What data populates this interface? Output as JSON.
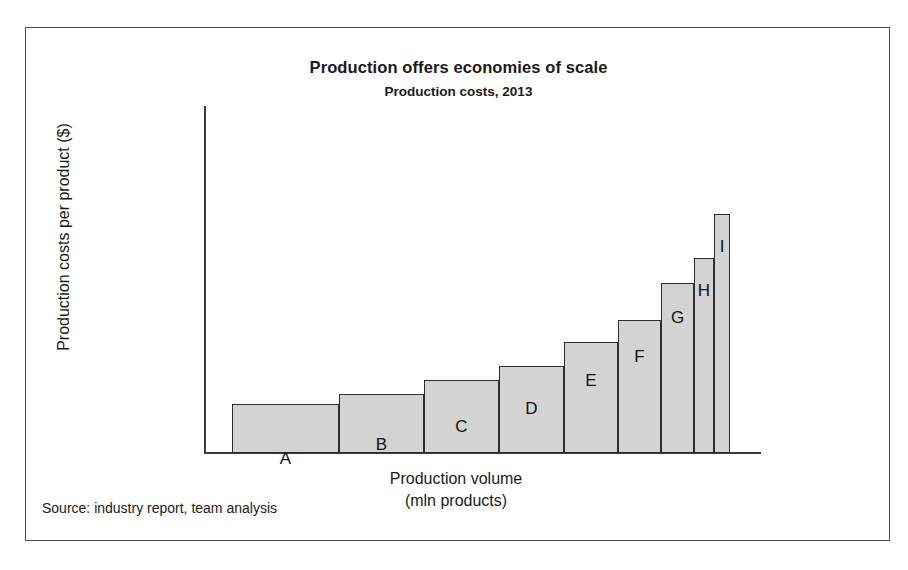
{
  "chart_data": {
    "type": "bar",
    "variant": "variable-width-bar",
    "title": "Production offers economies of scale",
    "subtitle": "Production costs, 2013",
    "xlabel": "Production volume",
    "xlabel_line2": "(mln products)",
    "ylabel": "Production costs per product ($)",
    "source": "Source: industry report, team analysis",
    "grid": false,
    "legend": false,
    "axis_tick_labels": false,
    "categories": [
      "A",
      "B",
      "C",
      "D",
      "E",
      "F",
      "G",
      "H",
      "I"
    ],
    "values": [
      20,
      24,
      30,
      36,
      46,
      55,
      71,
      82,
      100
    ],
    "widths": [
      107,
      85,
      75,
      65,
      54,
      43,
      33,
      20,
      16
    ],
    "colors": {
      "bar_fill": "#d3d3d3",
      "bar_stroke": "#2e2e2e",
      "axis": "#3a3a3a",
      "frame": "#4a4a4a",
      "text": "#1a1a1a"
    },
    "bars": [
      {
        "label": "A",
        "left": 28,
        "width": 107,
        "top": 376,
        "value": 20
      },
      {
        "label": "B",
        "left": 135,
        "width": 85,
        "top": 366,
        "value": 24
      },
      {
        "label": "C",
        "left": 220,
        "width": 75,
        "top": 352,
        "value": 30
      },
      {
        "label": "D",
        "left": 295,
        "width": 65,
        "top": 338,
        "value": 36
      },
      {
        "label": "E",
        "left": 360,
        "width": 54,
        "top": 314,
        "value": 46
      },
      {
        "label": "F",
        "left": 414,
        "width": 43,
        "top": 292,
        "value": 55
      },
      {
        "label": "G",
        "left": 457,
        "width": 33,
        "top": 255,
        "value": 71
      },
      {
        "label": "H",
        "left": 490,
        "width": 20,
        "top": 230,
        "value": 82
      },
      {
        "label": "I",
        "left": 510,
        "width": 16,
        "top": 186,
        "value": 100
      }
    ],
    "baseline_y": 425,
    "label_offsets": [
      44,
      40,
      36,
      32,
      28,
      26,
      24,
      22,
      22
    ]
  }
}
